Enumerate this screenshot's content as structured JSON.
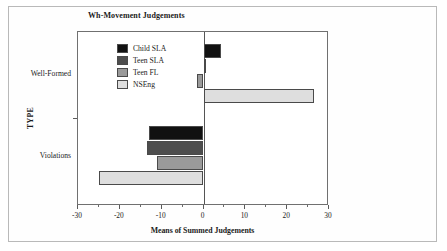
{
  "figure": {
    "title": "Wh-Movement Judgements"
  },
  "chart_data": {
    "type": "bar",
    "orientation": "horizontal",
    "title": "Wh-Movement Judgements",
    "xlabel": "Means of Summed Judgements",
    "ylabel": "TYPE",
    "categories": [
      "Well-Formed",
      "Violations"
    ],
    "xlim": [
      -30,
      30
    ],
    "xticks": [
      -30,
      -20,
      -10,
      0,
      10,
      20,
      30
    ],
    "xtick_labels": [
      "-30",
      "-20",
      "-10",
      "0",
      "10",
      "20",
      "30"
    ],
    "xminor_step": 5,
    "grid": false,
    "legend_position": "upper-left-inside",
    "series": [
      {
        "name": "Child SLA",
        "color": "#111111",
        "values": [
          4.2,
          -13.0
        ]
      },
      {
        "name": "Teen SLA",
        "color": "#4d4d4d",
        "values": [
          0.5,
          -13.5
        ]
      },
      {
        "name": "Teen FL",
        "color": "#9a9a9a",
        "values": [
          -1.5,
          -11.0
        ]
      },
      {
        "name": "NSEng",
        "color": "#dedede",
        "values": [
          26.3,
          -25.0
        ]
      }
    ]
  }
}
